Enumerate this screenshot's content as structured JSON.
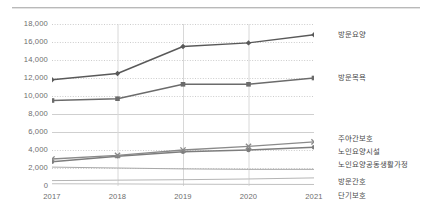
{
  "chart_data": {
    "type": "line",
    "title": "",
    "subtitle": "",
    "xlabel": "",
    "ylabel": "",
    "categories": [
      "2017",
      "2018",
      "2019",
      "2020",
      "2021"
    ],
    "ylim": [
      0,
      18000
    ],
    "yticks": [
      0,
      2000,
      4000,
      6000,
      8000,
      10000,
      12000,
      14000,
      16000,
      18000
    ],
    "ytick_labels": [
      "0",
      "2,000",
      "4,000",
      "6,000",
      "8,000",
      "10,000",
      "12,000",
      "14,000",
      "16,000",
      "18,000"
    ],
    "grid": true,
    "legend_position": "right-inline",
    "series": [
      {
        "name": "방문요양",
        "marker": "diamond",
        "color": "#595959",
        "values": [
          11800,
          12500,
          15500,
          15900,
          16800
        ]
      },
      {
        "name": "방문목욕",
        "marker": "square",
        "color": "#6b6b6b",
        "values": [
          9500,
          9700,
          11300,
          11300,
          12000
        ]
      },
      {
        "name": "주야간보호",
        "marker": "cross",
        "color": "#8a8a8a",
        "values": [
          3000,
          3400,
          4000,
          4400,
          4900
        ]
      },
      {
        "name": "노인요양시설",
        "marker": "circle",
        "color": "#7d7d7d",
        "values": [
          2700,
          3300,
          3800,
          4000,
          4300
        ]
      },
      {
        "name": "노인요양공동생활가정",
        "marker": "none",
        "color": "#a8a8a8",
        "values": [
          2100,
          2000,
          1900,
          1850,
          1850
        ]
      },
      {
        "name": "방문간호",
        "marker": "none",
        "color": "#b5b5b5",
        "values": [
          600,
          650,
          700,
          780,
          900
        ]
      },
      {
        "name": "단기보호",
        "marker": "none",
        "color": "#c0c0c0",
        "values": [
          250,
          230,
          200,
          180,
          170
        ]
      }
    ]
  },
  "axes": {
    "y_ticks": [
      {
        "label": "18,000",
        "value": 18000
      },
      {
        "label": "16,000",
        "value": 16000
      },
      {
        "label": "14,000",
        "value": 14000
      },
      {
        "label": "12,000",
        "value": 12000
      },
      {
        "label": "10,000",
        "value": 10000
      },
      {
        "label": "8,000",
        "value": 8000
      },
      {
        "label": "6,000",
        "value": 6000
      },
      {
        "label": "4,000",
        "value": 4000
      },
      {
        "label": "2,000",
        "value": 2000
      },
      {
        "label": "0",
        "value": 0
      }
    ],
    "x_ticks": [
      {
        "label": "2017"
      },
      {
        "label": "2018"
      },
      {
        "label": "2019"
      },
      {
        "label": "2020"
      },
      {
        "label": "2021"
      }
    ]
  },
  "series_labels": [
    {
      "name": "방문요양"
    },
    {
      "name": "방문목욕"
    },
    {
      "name": "주야간보호"
    },
    {
      "name": "노인요양시설"
    },
    {
      "name": "노인요양공동생활가정"
    },
    {
      "name": "방문간호"
    },
    {
      "name": "단기보호"
    }
  ]
}
